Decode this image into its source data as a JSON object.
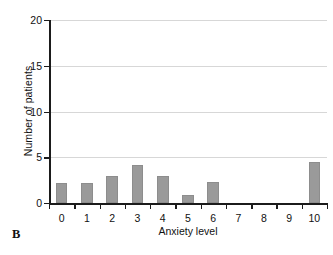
{
  "panel": {
    "label": "B"
  },
  "chart_data": {
    "type": "bar",
    "title": "",
    "subtitle": "",
    "xlabel": "Anxiety level",
    "ylabel": "Number of patients",
    "categories": [
      "0",
      "1",
      "2",
      "3",
      "4",
      "5",
      "6",
      "7",
      "8",
      "9",
      "10"
    ],
    "values": [
      2.2,
      2.2,
      2.9,
      4.1,
      3.0,
      0.9,
      2.3,
      0,
      0,
      0,
      4.5
    ],
    "series": [
      {
        "name": "Number of patients",
        "values": [
          2.2,
          2.2,
          2.9,
          4.1,
          3.0,
          0.9,
          2.3,
          0,
          0,
          0,
          4.5
        ]
      }
    ],
    "ylim": [
      0,
      20
    ],
    "y_ticks": [
      "0",
      "5",
      "10",
      "15",
      "20"
    ],
    "y_tick_values": [
      0,
      5,
      10,
      15,
      20
    ],
    "x_tick_labels": [
      "0",
      "1",
      "2",
      "3",
      "4",
      "5",
      "6",
      "7",
      "8",
      "9",
      "10"
    ],
    "grid": true,
    "grid_axis": "y",
    "legend": false,
    "legend_position": "none",
    "bar_color": "#9a9a9a",
    "axis_color": "#1b1b1b",
    "gridline_color": "#d7d7d7",
    "background_color": "#ffffff"
  }
}
